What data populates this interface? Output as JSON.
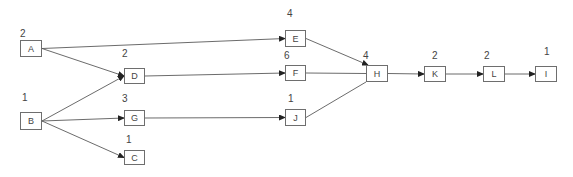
{
  "diagram": {
    "type": "activity-network",
    "nodes": [
      {
        "id": "A",
        "label": "A",
        "duration": "2",
        "x": 20,
        "y": 40,
        "w": 22,
        "h": 17,
        "dx": 20,
        "dy": 28
      },
      {
        "id": "B",
        "label": "B",
        "duration": "1",
        "x": 20,
        "y": 112,
        "w": 22,
        "h": 18,
        "dx": 22,
        "dy": 92
      },
      {
        "id": "D",
        "label": "D",
        "duration": "2",
        "x": 124,
        "y": 68,
        "w": 21,
        "h": 16,
        "dx": 122,
        "dy": 48
      },
      {
        "id": "G",
        "label": "G",
        "duration": "3",
        "x": 124,
        "y": 110,
        "w": 21,
        "h": 16,
        "dx": 122,
        "dy": 93
      },
      {
        "id": "C",
        "label": "C",
        "duration": "1",
        "x": 124,
        "y": 150,
        "w": 21,
        "h": 15,
        "dx": 126,
        "dy": 134
      },
      {
        "id": "E",
        "label": "E",
        "duration": "4",
        "x": 285,
        "y": 30,
        "w": 21,
        "h": 17,
        "dx": 287,
        "dy": 8
      },
      {
        "id": "F",
        "label": "F",
        "duration": "6",
        "x": 285,
        "y": 65,
        "w": 21,
        "h": 16,
        "dx": 284,
        "dy": 50
      },
      {
        "id": "J",
        "label": "J",
        "duration": "1",
        "x": 285,
        "y": 109,
        "w": 21,
        "h": 17,
        "dx": 288,
        "dy": 93
      },
      {
        "id": "H",
        "label": "H",
        "duration": "4",
        "x": 366,
        "y": 65,
        "w": 22,
        "h": 17,
        "dx": 363,
        "dy": 50
      },
      {
        "id": "K",
        "label": "K",
        "duration": "2",
        "x": 424,
        "y": 66,
        "w": 22,
        "h": 16,
        "dx": 432,
        "dy": 50
      },
      {
        "id": "L",
        "label": "L",
        "duration": "2",
        "x": 483,
        "y": 66,
        "w": 22,
        "h": 16,
        "dx": 484,
        "dy": 50
      },
      {
        "id": "I",
        "label": "I",
        "duration": "1",
        "x": 535,
        "y": 66,
        "w": 22,
        "h": 16,
        "dx": 544,
        "dy": 46
      }
    ],
    "edges": [
      {
        "from": "A",
        "to": "E",
        "arrow": true
      },
      {
        "from": "A",
        "to": "D",
        "arrow": true
      },
      {
        "from": "B",
        "to": "D",
        "arrow": true
      },
      {
        "from": "B",
        "to": "G",
        "arrow": true
      },
      {
        "from": "B",
        "to": "C",
        "arrow": true
      },
      {
        "from": "D",
        "to": "F",
        "arrow": true
      },
      {
        "from": "G",
        "to": "J",
        "arrow": true
      },
      {
        "from": "E",
        "to": "H",
        "arrow": true
      },
      {
        "from": "F",
        "to": "H",
        "arrow": false
      },
      {
        "from": "J",
        "to": "H",
        "arrow": false
      },
      {
        "from": "H",
        "to": "K",
        "arrow": true
      },
      {
        "from": "K",
        "to": "L",
        "arrow": true
      },
      {
        "from": "L",
        "to": "I",
        "arrow": true
      }
    ],
    "colors": {
      "line": "#5a5a5a",
      "border": "#6e6e6e",
      "text": "#444444"
    }
  }
}
